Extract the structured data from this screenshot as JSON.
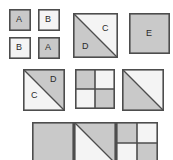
{
  "figure": {
    "canvas": {
      "width": 173,
      "height": 160,
      "background": "#ffffff"
    },
    "palette": {
      "fill_dark": "#c9c9c9",
      "fill_light": "#f4f4f4",
      "stroke": "#4d4d4d",
      "stroke_thin": "#6e6e6e",
      "label_color": "#2b2b2b"
    },
    "rows": [
      {
        "name": "row-1",
        "shapes": [
          {
            "name": "small-square-a-top-left",
            "type": "square",
            "fill": "dark",
            "x": 9,
            "y": 9,
            "size": 22,
            "labels": [
              {
                "text": "A",
                "x": 16,
                "y": 15
              }
            ]
          },
          {
            "name": "small-square-b-top-right",
            "type": "square",
            "fill": "light",
            "x": 38,
            "y": 9,
            "size": 22,
            "labels": [
              {
                "text": "B",
                "x": 45,
                "y": 15
              }
            ]
          },
          {
            "name": "small-square-b-bottom-left",
            "type": "square",
            "fill": "light",
            "x": 9,
            "y": 37,
            "size": 22,
            "labels": [
              {
                "text": "B",
                "x": 16,
                "y": 43
              }
            ]
          },
          {
            "name": "small-square-a-bottom-right",
            "type": "square",
            "fill": "dark",
            "x": 38,
            "y": 37,
            "size": 22,
            "labels": [
              {
                "text": "A",
                "x": 45,
                "y": 43
              }
            ]
          },
          {
            "name": "diagonal-square-cd-row1",
            "type": "diagonal-square",
            "diagonal": "tl-br",
            "lower_left_fill": "dark",
            "upper_right_fill": "light",
            "x": 73,
            "y": 13,
            "size": 45,
            "labels": [
              {
                "text": "C",
                "x": 102,
                "y": 24
              },
              {
                "text": "D",
                "x": 82,
                "y": 42
              }
            ]
          },
          {
            "name": "plain-square-e",
            "type": "square",
            "fill": "dark",
            "x": 129,
            "y": 13,
            "size": 41,
            "labels": [
              {
                "text": "E",
                "x": 146,
                "y": 29
              }
            ]
          }
        ]
      },
      {
        "name": "row-2",
        "shapes": [
          {
            "name": "diagonal-square-cd-row2",
            "type": "diagonal-square",
            "diagonal": "tl-br",
            "lower_left_fill": "light",
            "upper_right_fill": "dark",
            "x": 23,
            "y": 69,
            "size": 42,
            "labels": [
              {
                "text": "D",
                "x": 50,
                "y": 75
              },
              {
                "text": "C",
                "x": 31,
                "y": 91
              }
            ]
          },
          {
            "name": "quadrant-square-row2",
            "type": "quadrant-square",
            "quadrants": [
              "dark",
              "light",
              "light",
              "dark"
            ],
            "x": 75,
            "y": 69,
            "size": 40,
            "labels": []
          },
          {
            "name": "diagonal-square-unlabeled-row2",
            "type": "diagonal-square",
            "diagonal": "tl-br",
            "lower_left_fill": "dark",
            "upper_right_fill": "light",
            "x": 122,
            "y": 69,
            "size": 42,
            "labels": []
          }
        ]
      },
      {
        "name": "row-3",
        "shapes": [
          {
            "name": "plain-square-bottom-left",
            "type": "square",
            "fill": "dark",
            "x": 32,
            "y": 122,
            "size": 42,
            "labels": []
          },
          {
            "name": "diagonal-square-bottom-middle",
            "type": "diagonal-square",
            "diagonal": "tl-br",
            "lower_left_fill": "light",
            "upper_right_fill": "dark",
            "x": 74,
            "y": 122,
            "size": 42,
            "labels": []
          },
          {
            "name": "quadrant-square-bottom-right",
            "type": "quadrant-square",
            "quadrants": [
              "dark",
              "light",
              "light",
              "dark"
            ],
            "x": 116,
            "y": 122,
            "size": 42,
            "labels": []
          }
        ]
      }
    ]
  }
}
